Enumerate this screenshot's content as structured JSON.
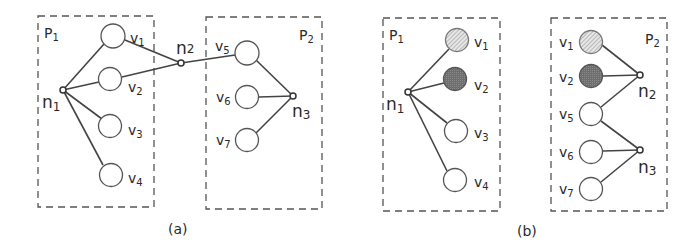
{
  "colors": {
    "stroke": "#444444",
    "box": "#555555",
    "hatched_fill": "#d0d0d0",
    "dark_fill": "#7a7a7a",
    "background": "#ffffff"
  },
  "panel_a": {
    "caption": "(a)",
    "partitions": [
      {
        "id": "P1",
        "label": "P",
        "sub": "1"
      },
      {
        "id": "P2",
        "label": "P",
        "sub": "2"
      }
    ],
    "vertices": [
      {
        "id": "v1",
        "label": "v",
        "sub": "1",
        "partition": "P1",
        "fill": "none"
      },
      {
        "id": "v2",
        "label": "v",
        "sub": "2",
        "partition": "P1",
        "fill": "none"
      },
      {
        "id": "v3",
        "label": "v",
        "sub": "3",
        "partition": "P1",
        "fill": "none"
      },
      {
        "id": "v4",
        "label": "v",
        "sub": "4",
        "partition": "P1",
        "fill": "none"
      },
      {
        "id": "v5",
        "label": "v",
        "sub": "5",
        "partition": "P2",
        "fill": "none"
      },
      {
        "id": "v6",
        "label": "v",
        "sub": "6",
        "partition": "P2",
        "fill": "none"
      },
      {
        "id": "v7",
        "label": "v",
        "sub": "7",
        "partition": "P2",
        "fill": "none"
      }
    ],
    "nets": [
      {
        "id": "n1",
        "label": "n",
        "sub": "1",
        "pins": [
          "v1",
          "v2",
          "v3",
          "v4"
        ]
      },
      {
        "id": "n2",
        "label": "n",
        "sub": "2",
        "pins": [
          "v1",
          "v2",
          "v5"
        ]
      },
      {
        "id": "n3",
        "label": "n",
        "sub": "3",
        "pins": [
          "v5",
          "v6",
          "v7"
        ]
      }
    ]
  },
  "panel_b": {
    "caption": "(b)",
    "partitions": [
      {
        "id": "P1",
        "label": "P",
        "sub": "1"
      },
      {
        "id": "P2",
        "label": "P",
        "sub": "2"
      }
    ],
    "vertices": [
      {
        "id": "v1",
        "label": "v",
        "sub": "1",
        "partition": "P1",
        "fill": "hatched"
      },
      {
        "id": "v2",
        "label": "v",
        "sub": "2",
        "partition": "P1",
        "fill": "dark"
      },
      {
        "id": "v3",
        "label": "v",
        "sub": "3",
        "partition": "P1",
        "fill": "none"
      },
      {
        "id": "v4",
        "label": "v",
        "sub": "4",
        "partition": "P1",
        "fill": "none"
      },
      {
        "id": "v1_replica",
        "label": "v",
        "sub": "1",
        "partition": "P2",
        "fill": "hatched"
      },
      {
        "id": "v2_replica",
        "label": "v",
        "sub": "2",
        "partition": "P2",
        "fill": "dark"
      },
      {
        "id": "v5",
        "label": "v",
        "sub": "5",
        "partition": "P2",
        "fill": "none"
      },
      {
        "id": "v6",
        "label": "v",
        "sub": "6",
        "partition": "P2",
        "fill": "none"
      },
      {
        "id": "v7",
        "label": "v",
        "sub": "7",
        "partition": "P2",
        "fill": "none"
      }
    ],
    "nets": [
      {
        "id": "n1",
        "label": "n",
        "sub": "1",
        "pins": [
          "v1",
          "v2",
          "v3",
          "v4"
        ]
      },
      {
        "id": "n2",
        "label": "n",
        "sub": "2",
        "pins": [
          "v1_replica",
          "v2_replica",
          "v5"
        ]
      },
      {
        "id": "n3",
        "label": "n",
        "sub": "3",
        "pins": [
          "v5",
          "v6",
          "v7"
        ]
      }
    ]
  }
}
